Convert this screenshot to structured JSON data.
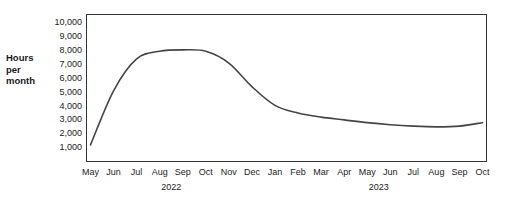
{
  "chart_data": {
    "type": "line",
    "title": "",
    "xlabel": "",
    "ylabel": "Hours per month",
    "ylabel_lines": [
      "Hours",
      "per",
      "month"
    ],
    "ylim": [
      0,
      10600
    ],
    "ytick_values": [
      10000,
      9000,
      8000,
      7000,
      6000,
      5000,
      4000,
      3000,
      2000,
      1000
    ],
    "ytick_labels": [
      "10,000",
      "9,000",
      "8,000",
      "7,000",
      "6,000",
      "5,000",
      "4,000",
      "3,000",
      "2,000",
      "1,000"
    ],
    "grid": false,
    "legend": "none",
    "categories": [
      "May",
      "Jun",
      "Jul",
      "Aug",
      "Sep",
      "Oct",
      "Nov",
      "Dec",
      "Jan",
      "Feb",
      "Mar",
      "Apr",
      "May",
      "Jun",
      "Jul",
      "Aug",
      "Sep",
      "Oct"
    ],
    "year_groups": [
      {
        "label": "2022",
        "start_index": 0,
        "end_index": 7
      },
      {
        "label": "2023",
        "start_index": 8,
        "end_index": 17
      }
    ],
    "series": [
      {
        "name": "Hours per month",
        "color": "#444444",
        "values": [
          1200,
          5100,
          7400,
          7950,
          8050,
          7950,
          7100,
          5400,
          4050,
          3500,
          3200,
          3000,
          2800,
          2650,
          2550,
          2500,
          2550,
          2800
        ]
      }
    ]
  }
}
